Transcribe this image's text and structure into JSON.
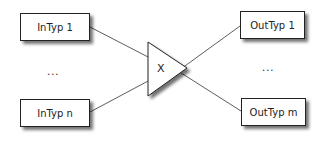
{
  "diagram": {
    "inputs": [
      {
        "label": "InTyp 1"
      },
      {
        "label": "InTyp n"
      }
    ],
    "input_ellipsis": "...",
    "operator": {
      "label": "X",
      "shape": "triangle"
    },
    "outputs": [
      {
        "label": "OutTyp 1"
      },
      {
        "label": "OutTyp m"
      }
    ],
    "output_ellipsis": "..."
  }
}
